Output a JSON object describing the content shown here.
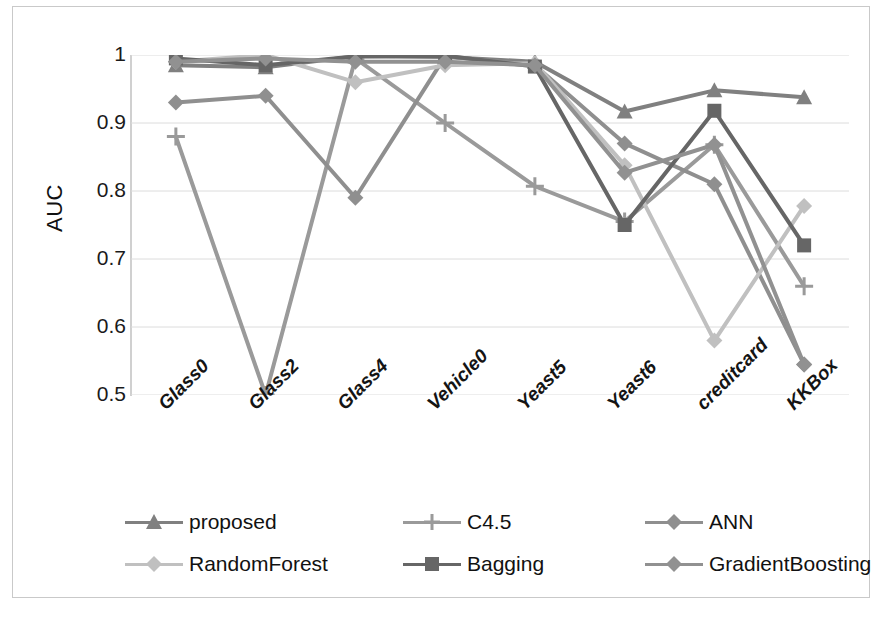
{
  "chart_data": {
    "type": "line",
    "title": "",
    "xlabel": "",
    "ylabel": "AUC",
    "ylim": [
      0.5,
      1.0
    ],
    "ytick_labels": [
      "1",
      "0.9",
      "0.8",
      "0.7",
      "0.6",
      "0.5"
    ],
    "yticks": [
      1,
      0.9,
      0.8,
      0.7,
      0.6,
      0.5
    ],
    "grid": true,
    "legend_position": "bottom",
    "categories": [
      "Glass0",
      "Glass2",
      "Glass4",
      "Vehicle0",
      "Yeast5",
      "Yeast6",
      "creditcard",
      "KKBox"
    ],
    "series": [
      {
        "name": "proposed",
        "marker": "triangle",
        "color": "#808080",
        "values": [
          0.985,
          0.982,
          0.998,
          0.997,
          0.99,
          0.917,
          0.948,
          0.938
        ]
      },
      {
        "name": "C4.5",
        "marker": "plus",
        "color": "#9a9a9a",
        "values": [
          0.88,
          0.5,
          0.995,
          0.9,
          0.807,
          0.755,
          0.868,
          0.66
        ]
      },
      {
        "name": "ANN",
        "marker": "diamond",
        "color": "#8f8f8f",
        "values": [
          0.93,
          0.94,
          0.79,
          0.998,
          0.985,
          0.87,
          0.81,
          0.545
        ]
      },
      {
        "name": "RandomForest",
        "marker": "diamond",
        "color": "#c0c0c0",
        "values": [
          0.99,
          1.0,
          0.96,
          0.985,
          0.988,
          0.838,
          0.58,
          0.778
        ]
      },
      {
        "name": "Bagging",
        "marker": "square",
        "color": "#666666",
        "values": [
          0.995,
          0.985,
          0.998,
          0.999,
          0.983,
          0.75,
          0.918,
          0.72
        ]
      },
      {
        "name": "GradientBoosting",
        "marker": "diamond",
        "color": "#919191",
        "values": [
          0.99,
          0.995,
          0.99,
          0.99,
          0.985,
          0.827,
          0.868,
          0.545
        ]
      }
    ]
  },
  "axis": {
    "y_title": "AUC"
  },
  "legend": {
    "items": [
      {
        "label": "proposed"
      },
      {
        "label": "C4.5"
      },
      {
        "label": "ANN"
      },
      {
        "label": "RandomForest"
      },
      {
        "label": "Bagging"
      },
      {
        "label": "GradientBoosting"
      }
    ]
  },
  "caption": {
    "text": ""
  }
}
